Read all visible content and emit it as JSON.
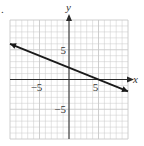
{
  "problem_marker": ".",
  "chart_data": {
    "type": "line",
    "title": "",
    "xlabel": "x",
    "ylabel": "y",
    "xlim": [
      -10,
      10
    ],
    "ylim": [
      -10,
      10
    ],
    "grid": true,
    "grid_step": 1,
    "x_ticks_labeled": [
      {
        "value": -5,
        "label": "−5"
      },
      {
        "value": 5,
        "label": "5"
      }
    ],
    "y_ticks_labeled": [
      {
        "value": 5,
        "label": "5"
      },
      {
        "value": -5,
        "label": "−5"
      }
    ],
    "series": [
      {
        "name": "line",
        "equation": "y = -2/5 x + 2",
        "x": [
          -10,
          10
        ],
        "y": [
          6,
          -2
        ],
        "y_intercept": 2,
        "x_intercept": 5,
        "arrows": "both"
      }
    ],
    "legend": null
  },
  "colors": {
    "grid": "#c8c8c8",
    "axis": "#2a2a2a",
    "line": "#1a1a1a",
    "text": "#333333"
  }
}
